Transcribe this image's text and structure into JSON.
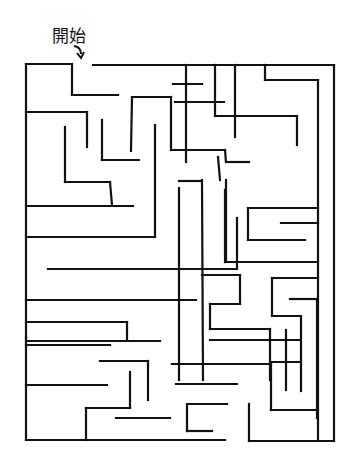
{
  "puzzle": {
    "type": "maze",
    "start_label": "開始",
    "start_marker": "curved-arrow-down",
    "wall_color": "#111111",
    "background": "#ffffff",
    "walls": [
      [
        26,
        64,
        72,
        64
      ],
      [
        72,
        64,
        72,
        95
      ],
      [
        72,
        95,
        118,
        95
      ],
      [
        93,
        65,
        334,
        65
      ],
      [
        26,
        64,
        26,
        440
      ],
      [
        334,
        65,
        334,
        440
      ],
      [
        26,
        112,
        87,
        112
      ],
      [
        87,
        112,
        87,
        147
      ],
      [
        65,
        127,
        65,
        182
      ],
      [
        65,
        182,
        110,
        182
      ],
      [
        110,
        182,
        112,
        205
      ],
      [
        26,
        206,
        133,
        206
      ],
      [
        102,
        120,
        102,
        160
      ],
      [
        102,
        160,
        139,
        160
      ],
      [
        132,
        97,
        171,
        97
      ],
      [
        132,
        97,
        131,
        151
      ],
      [
        171,
        97,
        171,
        150
      ],
      [
        171,
        150,
        225,
        150
      ],
      [
        225,
        150,
        226,
        162
      ],
      [
        226,
        162,
        249,
        162
      ],
      [
        186,
        65,
        186,
        162
      ],
      [
        215,
        65,
        215,
        116
      ],
      [
        215,
        116,
        297,
        116
      ],
      [
        297,
        116,
        297,
        145
      ],
      [
        265,
        65,
        265,
        80
      ],
      [
        265,
        80,
        318,
        80
      ],
      [
        318,
        80,
        318,
        440
      ],
      [
        235,
        65,
        235,
        137
      ],
      [
        175,
        102,
        224,
        102
      ],
      [
        173,
        84,
        202,
        84
      ],
      [
        155,
        125,
        155,
        237
      ],
      [
        155,
        237,
        26,
        237
      ],
      [
        179,
        188,
        179,
        380
      ],
      [
        179,
        181,
        201,
        181
      ],
      [
        202,
        180,
        203,
        380
      ],
      [
        226,
        180,
        226,
        262
      ],
      [
        226,
        262,
        318,
        262
      ],
      [
        225,
        190,
        225,
        262
      ],
      [
        248,
        208,
        318,
        208
      ],
      [
        248,
        208,
        248,
        240
      ],
      [
        248,
        240,
        305,
        240
      ],
      [
        281,
        223,
        318,
        223
      ],
      [
        218,
        157,
        220,
        180
      ],
      [
        26,
        300,
        196,
        300
      ],
      [
        48,
        269,
        237,
        269
      ],
      [
        237,
        269,
        237,
        218
      ],
      [
        26,
        322,
        127,
        322
      ],
      [
        127,
        322,
        127,
        340
      ],
      [
        26,
        345,
        110,
        345
      ],
      [
        26,
        341,
        160,
        341
      ],
      [
        202,
        275,
        240,
        275
      ],
      [
        240,
        275,
        240,
        304
      ],
      [
        240,
        304,
        210,
        304
      ],
      [
        210,
        304,
        210,
        329
      ],
      [
        210,
        329,
        270,
        329
      ],
      [
        270,
        329,
        270,
        380
      ],
      [
        210,
        340,
        300,
        340
      ],
      [
        272,
        278,
        318,
        278
      ],
      [
        272,
        278,
        272,
        316
      ],
      [
        272,
        316,
        301,
        316
      ],
      [
        301,
        316,
        301,
        391
      ],
      [
        290,
        299,
        317,
        299
      ],
      [
        317,
        299,
        317,
        418
      ],
      [
        272,
        362,
        301,
        362
      ],
      [
        286,
        330,
        286,
        390
      ],
      [
        100,
        361,
        148,
        361
      ],
      [
        148,
        361,
        148,
        400
      ],
      [
        26,
        385,
        107,
        385
      ],
      [
        130,
        372,
        130,
        408
      ],
      [
        130,
        408,
        86,
        408
      ],
      [
        86,
        408,
        86,
        440
      ],
      [
        26,
        440,
        225,
        440
      ],
      [
        172,
        364,
        271,
        364
      ],
      [
        271,
        364,
        271,
        410
      ],
      [
        271,
        410,
        318,
        410
      ],
      [
        172,
        364,
        270,
        364
      ],
      [
        187,
        404,
        227,
        404
      ],
      [
        187,
        404,
        187,
        431
      ],
      [
        187,
        431,
        212,
        431
      ],
      [
        116,
        418,
        170,
        418
      ],
      [
        249,
        404,
        249,
        441
      ],
      [
        249,
        441,
        334,
        441
      ],
      [
        176,
        384,
        237,
        384
      ],
      [
        26,
        338,
        26,
        338
      ]
    ]
  }
}
